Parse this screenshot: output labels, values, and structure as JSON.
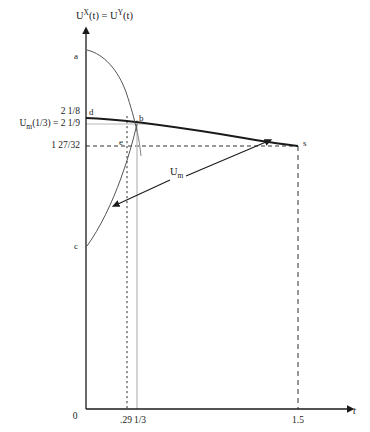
{
  "figure": {
    "axis_label_y_html": "U<sup>X</sup>(t) = U<sup>Y</sup>(t)",
    "axis_label_y_text": "UX(t) = UY(t)",
    "axis_label_x": "t",
    "origin_label": "0"
  },
  "y_ticks": [
    {
      "label": "2 1/8",
      "value": 2.125,
      "y_px": 112
    },
    {
      "label": "U_m(1/3) = 2 1/9",
      "value": 2.1111,
      "y_px": 124
    },
    {
      "label": "1 27/32",
      "value": 1.84375,
      "y_px": 146
    }
  ],
  "x_ticks": [
    {
      "label": "0",
      "value": 0
    },
    {
      "label": ".29",
      "value": 0.29
    },
    {
      "label": "1/3",
      "value": 0.3333
    },
    {
      "label": "1.5",
      "value": 1.5
    }
  ],
  "points": [
    {
      "name": "a",
      "label": "a"
    },
    {
      "name": "b",
      "label": "b"
    },
    {
      "name": "c",
      "label": "c"
    },
    {
      "name": "d",
      "label": "d"
    },
    {
      "name": "e",
      "label": "e"
    },
    {
      "name": "s",
      "label": "s"
    }
  ],
  "annotations": [
    {
      "name": "um-curve-label",
      "label": "U_m",
      "html": "U<sub>m</sub>"
    }
  ],
  "chart_data": {
    "type": "line",
    "title": "",
    "xlabel": "t",
    "ylabel": "UX(t) = UY(t)",
    "xlim": [
      0,
      1.72
    ],
    "ylim": [
      0,
      3.0
    ],
    "grid": false,
    "legend": "none",
    "series": [
      {
        "name": "U_m",
        "description": "Mediator utility curve from point d (t=0, U=2.125) gently decreasing through b to s (t=1.5, U=1.84375)",
        "points": [
          {
            "t": 0.0,
            "u": 2.125,
            "marker": "d"
          },
          {
            "t": 0.33,
            "u": 2.111,
            "marker": "b"
          },
          {
            "t": 0.75,
            "u": 2.04
          },
          {
            "t": 1.1,
            "u": 1.95
          },
          {
            "t": 1.4,
            "u": 1.87
          },
          {
            "t": 1.5,
            "u": 1.84375,
            "marker": "s"
          }
        ]
      },
      {
        "name": "U_a_declining",
        "description": "Steeply declining curve starting at point a (t=0, high U) crossing the mediator curve at b",
        "points": [
          {
            "t": 0.0,
            "u": 2.73,
            "marker": "a"
          },
          {
            "t": 0.12,
            "u": 2.63
          },
          {
            "t": 0.23,
            "u": 2.42
          },
          {
            "t": 0.3,
            "u": 2.2
          },
          {
            "t": 0.33,
            "u": 2.111,
            "marker": "b"
          }
        ]
      },
      {
        "name": "U_c_rising",
        "description": "Rising curve from point c (t=0, low U) up through e-level to point b",
        "points": [
          {
            "t": 0.0,
            "u": 1.12,
            "marker": "c"
          },
          {
            "t": 0.13,
            "u": 1.42
          },
          {
            "t": 0.22,
            "u": 1.66
          },
          {
            "t": 0.28,
            "u": 1.86,
            "marker": "e"
          },
          {
            "t": 0.33,
            "u": 2.111,
            "marker": "b"
          }
        ]
      }
    ],
    "reference_lines": [
      {
        "name": "vline-029",
        "orientation": "vertical",
        "value": 0.29,
        "style": "dotted"
      },
      {
        "name": "vline-third",
        "orientation": "vertical",
        "value": 0.3333,
        "style": "solid-gray"
      },
      {
        "name": "vline-15",
        "orientation": "vertical",
        "value": 1.5,
        "style": "dashed"
      },
      {
        "name": "hline-1-27-32",
        "orientation": "horizontal",
        "value": 1.84375,
        "style": "dashed"
      },
      {
        "name": "hline-2-1-9",
        "orientation": "horizontal",
        "value": 2.1111,
        "style": "solid-gray"
      }
    ],
    "annotations": [
      {
        "name": "um-pointer-left",
        "text": "U_m",
        "arrow_to": "U_c_rising curve"
      },
      {
        "name": "um-pointer-right",
        "text": "U_m",
        "arrow_to": "U_m mediator curve near t=1.4"
      }
    ]
  }
}
